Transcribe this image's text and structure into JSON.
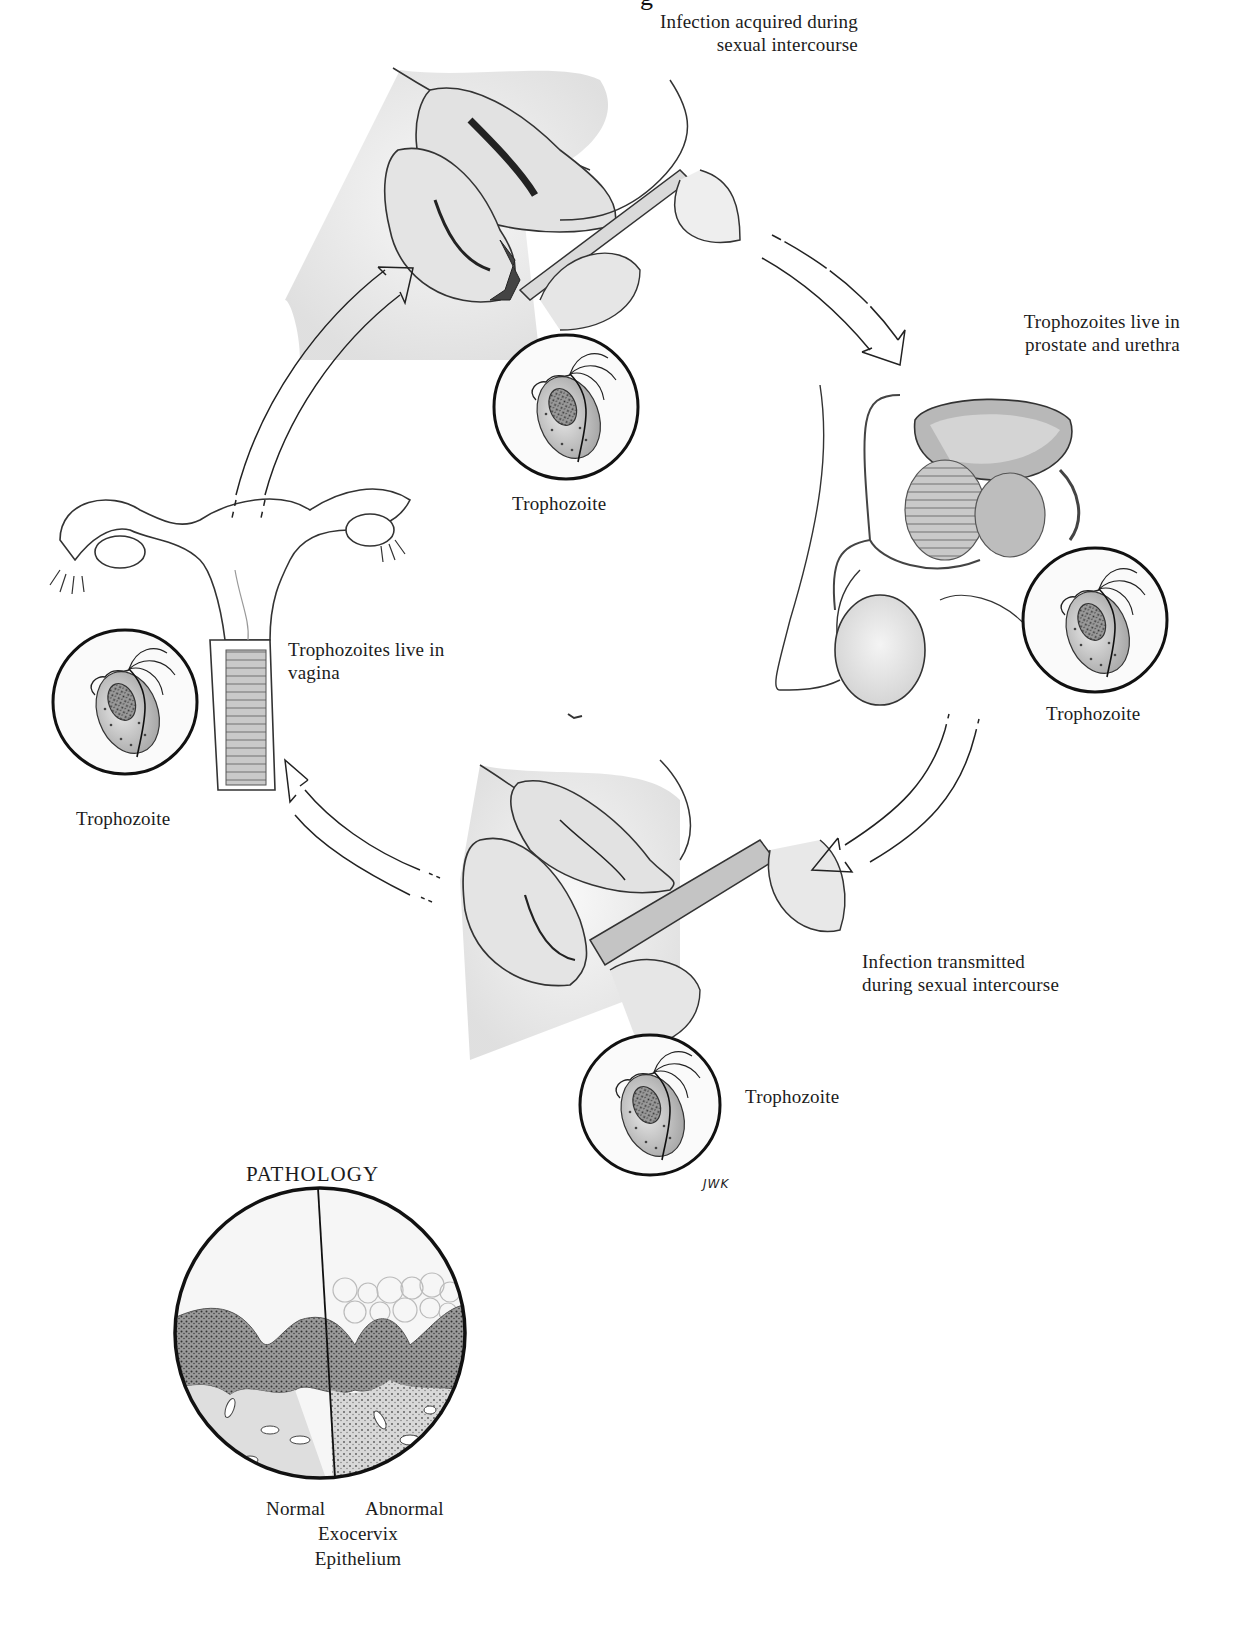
{
  "figure": {
    "title_partial": "g",
    "cycle_labels": {
      "top": [
        "Infection acquired during",
        "sexual intercourse"
      ],
      "right": [
        "Trophozoites live in",
        "prostate and urethra"
      ],
      "left": [
        "Trophozoites live in",
        "vagina"
      ],
      "bottom": [
        "Infection transmitted",
        "during sexual intercourse"
      ]
    },
    "trophozoite_labels": {
      "top": "Trophozoite",
      "right": "Trophozoite",
      "left": "Trophozoite",
      "bottom": "Trophozoite"
    },
    "signature": "JWK",
    "pathology": {
      "title": "PATHOLOGY",
      "left_label": "Normal",
      "right_label": "Abnormal",
      "caption_line1": "Exocervix",
      "caption_line2": "Epithelium"
    },
    "colors": {
      "ink": "#1a1a1a",
      "tissue_fill": "#e6e6e6",
      "dark_fill": "#4a4a4a",
      "background": "#ffffff"
    }
  }
}
